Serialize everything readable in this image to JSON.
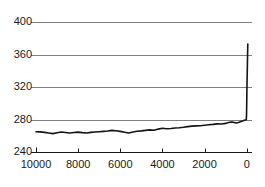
{
  "chart_data": {
    "type": "line",
    "title": "",
    "subtitle": "",
    "xlabel": "",
    "ylabel": "",
    "xlim": [
      10000,
      -250
    ],
    "ylim": [
      240,
      400
    ],
    "x_tick_labels": [
      "10000",
      "8000",
      "6000",
      "4000",
      "2000",
      "0"
    ],
    "x_ticks": [
      10000,
      8000,
      6000,
      4000,
      2000,
      0
    ],
    "y_tick_labels": [
      "400",
      "360",
      "320",
      "280",
      "240"
    ],
    "y_ticks": [
      400,
      360,
      320,
      280,
      240
    ],
    "x_axis_reversed": true,
    "grid": "horizontal",
    "legend": "none",
    "series": [
      {
        "name": "series-1",
        "color": "#141414",
        "line_width": 1.6,
        "x": [
          10000,
          9800,
          9600,
          9400,
          9200,
          9000,
          8800,
          8600,
          8400,
          8200,
          8000,
          7800,
          7600,
          7400,
          7200,
          7000,
          6800,
          6600,
          6400,
          6200,
          6000,
          5800,
          5600,
          5400,
          5200,
          5000,
          4800,
          4600,
          4400,
          4200,
          4000,
          3800,
          3600,
          3400,
          3200,
          3000,
          2800,
          2600,
          2400,
          2200,
          2000,
          1800,
          1600,
          1400,
          1200,
          1000,
          900,
          800,
          700,
          600,
          500,
          400,
          300,
          250,
          200,
          160,
          120,
          100,
          80,
          60,
          40,
          20,
          10,
          0,
          -10,
          -30,
          -45,
          -50
        ],
        "y": [
          265.0,
          264.8,
          264.2,
          263.4,
          262.6,
          263.6,
          264.6,
          264.0,
          263.4,
          264.0,
          264.5,
          263.8,
          263.4,
          264.2,
          264.6,
          265.0,
          265.4,
          265.8,
          266.6,
          266.2,
          265.4,
          264.4,
          263.4,
          264.6,
          265.6,
          266.0,
          266.6,
          267.2,
          266.8,
          268.2,
          269.2,
          268.6,
          269.0,
          269.6,
          269.8,
          270.4,
          271.2,
          271.8,
          272.2,
          272.4,
          273.0,
          273.6,
          274.0,
          274.6,
          274.4,
          275.2,
          276.0,
          276.6,
          277.0,
          276.4,
          275.6,
          276.2,
          277.2,
          277.8,
          278.2,
          278.6,
          279.0,
          279.2,
          279.4,
          279.4,
          279.6,
          280.0,
          285.0,
          300.0,
          320.0,
          345.0,
          366.0,
          373.0
        ]
      }
    ]
  },
  "axes": {
    "plot_left_px": 36,
    "plot_right_px": 252,
    "plot_top_px": 22,
    "plot_bottom_px": 152,
    "gridline_color": "#808080",
    "axis_color": "#1a1a1a",
    "background": "#ffffff"
  }
}
